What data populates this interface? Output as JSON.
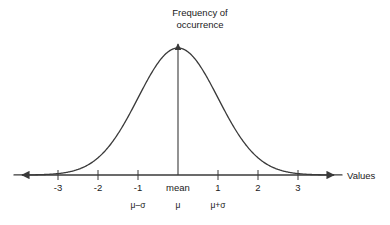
{
  "figure": {
    "title_line1": "Frequency of",
    "title_line2": "occurrence",
    "x_axis_name": "Values",
    "background_color": "#ffffff",
    "curve_color": "#3a3a3a",
    "axis_color": "#3a3a3a",
    "text_color": "#1a1a1a"
  },
  "chart_data": {
    "type": "line",
    "title": "Frequency of occurrence",
    "xlabel": "Values",
    "ylabel": "Frequency of occurrence",
    "xlim": [
      -4.1,
      4.1
    ],
    "ylim": [
      0,
      1
    ],
    "grid": false,
    "legend": null,
    "distribution": {
      "name": "normal",
      "mean": 0,
      "std_dev": 1,
      "peak_value": 1
    },
    "x_ticks": [
      {
        "value": -3,
        "label": "-3",
        "sigma_label": ""
      },
      {
        "value": -2,
        "label": "-2",
        "sigma_label": ""
      },
      {
        "value": -1,
        "label": "-1",
        "sigma_label": "μ–σ"
      },
      {
        "value": 0,
        "label": "mean",
        "sigma_label": "μ"
      },
      {
        "value": 1,
        "label": "1",
        "sigma_label": "μ+σ"
      },
      {
        "value": 2,
        "label": "2",
        "sigma_label": ""
      },
      {
        "value": 3,
        "label": "3",
        "sigma_label": ""
      }
    ],
    "x": [
      -4,
      -3.5,
      -3,
      -2.5,
      -2,
      -1.5,
      -1,
      -0.5,
      0,
      0.5,
      1,
      1.5,
      2,
      2.5,
      3,
      3.5,
      4
    ],
    "y": [
      0.0003,
      0.0022,
      0.0111,
      0.0439,
      0.1353,
      0.3247,
      0.6065,
      0.8825,
      1.0,
      0.8825,
      0.6065,
      0.3247,
      0.1353,
      0.0439,
      0.0111,
      0.0022,
      0.0003
    ],
    "annotations": []
  }
}
